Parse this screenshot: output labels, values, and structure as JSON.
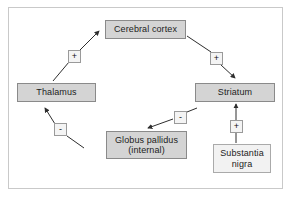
{
  "diagram": {
    "frame_color": "#c9c9c9",
    "node_fill": "#d4d4d4",
    "node_border": "#8a8a8a",
    "light_fill": "#f2f2f2",
    "line_color": "#3a3a3a",
    "nodes": [
      {
        "id": "cerebral_cortex",
        "label": "Cerebral cortex",
        "style": "filled"
      },
      {
        "id": "thalamus",
        "label": "Thalamus",
        "style": "filled"
      },
      {
        "id": "striatum",
        "label": "Striatum",
        "style": "filled"
      },
      {
        "id": "globus_pallidus",
        "label": "Globus pallidus\n(internal)",
        "style": "filled"
      },
      {
        "id": "substantia_nigra",
        "label": "Substantia\nnigra",
        "style": "light"
      }
    ],
    "signs": [
      {
        "id": "sign-cortex-from-thalamus",
        "symbol": "+",
        "edge": "Thalamus to Cerebral cortex"
      },
      {
        "id": "sign-cortex-to-striatum",
        "symbol": "+",
        "edge": "Cerebral cortex to Striatum"
      },
      {
        "id": "sign-striatum-to-gpi",
        "symbol": "-",
        "edge": "Striatum to Globus pallidus (internal)"
      },
      {
        "id": "sign-gpi-to-thalamus",
        "symbol": "-",
        "edge": "Globus pallidus (internal) to Thalamus"
      },
      {
        "id": "sign-nigra-to-striatum",
        "symbol": "+",
        "edge": "Substantia nigra to Striatum"
      }
    ],
    "edges": [
      {
        "from": "thalamus",
        "to": "cerebral_cortex",
        "sign": "+"
      },
      {
        "from": "cerebral_cortex",
        "to": "striatum",
        "sign": "+"
      },
      {
        "from": "striatum",
        "to": "globus_pallidus",
        "sign": "-"
      },
      {
        "from": "globus_pallidus",
        "to": "thalamus",
        "sign": "-"
      },
      {
        "from": "substantia_nigra",
        "to": "striatum",
        "sign": "+"
      }
    ]
  }
}
